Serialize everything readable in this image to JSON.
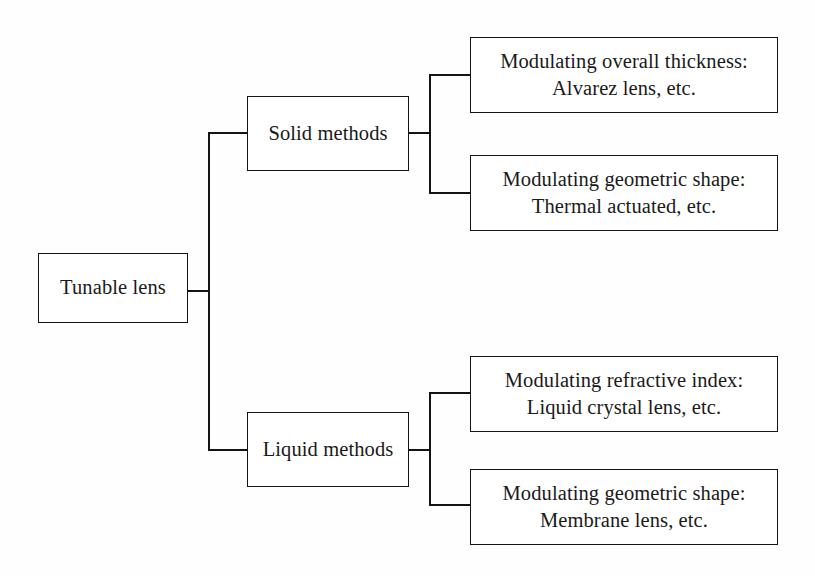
{
  "diagram": {
    "type": "tree",
    "orientation": "left-to-right",
    "background_color": "#fefefe",
    "line_color": "#141414",
    "box_fill": "#ffffff",
    "root": {
      "label": "Tunable lens"
    },
    "branches": [
      {
        "label": "Solid methods",
        "children": [
          {
            "line1": "Modulating overall thickness:",
            "line2": "Alvarez lens, etc."
          },
          {
            "line1": "Modulating geometric shape:",
            "line2": "Thermal actuated, etc."
          }
        ]
      },
      {
        "label": "Liquid methods",
        "children": [
          {
            "line1": "Modulating refractive index:",
            "line2": "Liquid crystal lens, etc."
          },
          {
            "line1": "Modulating geometric shape:",
            "line2": "Membrane lens, etc."
          }
        ]
      }
    ]
  }
}
